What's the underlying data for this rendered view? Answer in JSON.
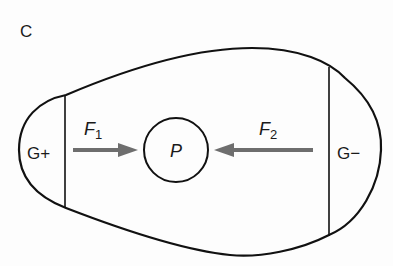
{
  "panel_label": "C",
  "regions": {
    "left": {
      "label": "G+"
    },
    "right": {
      "label": "G−"
    }
  },
  "particle": {
    "label": "P"
  },
  "forces": [
    {
      "symbol": "F",
      "subscript": "1",
      "direction": "right"
    },
    {
      "symbol": "F",
      "subscript": "2",
      "direction": "left"
    }
  ],
  "colors": {
    "outline": "#111111",
    "arrow": "#6e6e6e"
  }
}
